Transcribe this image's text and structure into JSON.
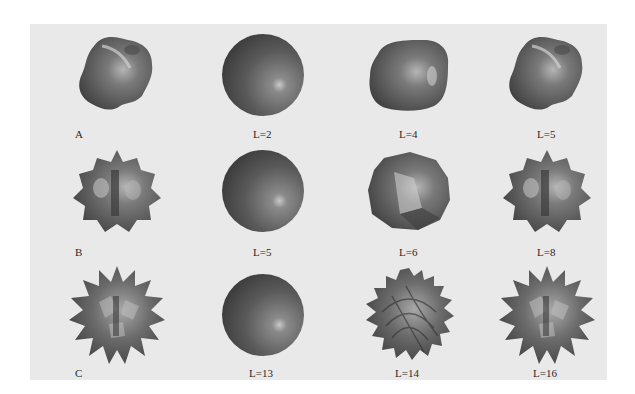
{
  "figure": {
    "colors": {
      "background": "#e9e9e9",
      "shape_dark": "#3a3a3a",
      "shape_mid": "#6e6e6e",
      "shape_light": "#bdbdbd",
      "label": "#2a2a2a"
    },
    "rows": [
      {
        "name": "A",
        "cells": [
          {
            "label": "A",
            "shape": "original-A"
          },
          {
            "label": "L=2",
            "shape": "sphere"
          },
          {
            "label": "L=4",
            "shape": "rounded-cube"
          },
          {
            "label": "L=5",
            "shape": "lumpy"
          }
        ]
      },
      {
        "name": "B",
        "cells": [
          {
            "label": "B",
            "shape": "original-B"
          },
          {
            "label": "L=5",
            "shape": "sphere"
          },
          {
            "label": "L=6",
            "shape": "faceted"
          },
          {
            "label": "L=8",
            "shape": "star-lumpy"
          }
        ]
      },
      {
        "name": "C",
        "cells": [
          {
            "label": "C",
            "shape": "original-C"
          },
          {
            "label": "L=13",
            "shape": "sphere"
          },
          {
            "label": "L=14",
            "shape": "spiky-regular"
          },
          {
            "label": "L=16",
            "shape": "spiky"
          }
        ]
      }
    ]
  }
}
